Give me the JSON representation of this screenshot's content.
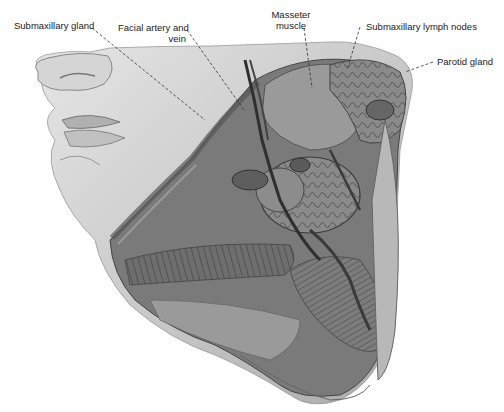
{
  "figure": {
    "labels": [
      {
        "id": "submaxillary-gland",
        "text": "Submaxillary gland"
      },
      {
        "id": "facial-artery-vein",
        "line1": "Facial artery and",
        "line2": "vein"
      },
      {
        "id": "masseter-muscle",
        "line1": "Masseter",
        "line2": "muscle"
      },
      {
        "id": "submaxillary-lymph-nodes",
        "text": "Submaxillary lymph nodes"
      },
      {
        "id": "parotid-gland",
        "text": "Parotid gland"
      }
    ]
  },
  "colors": {
    "background": "#ffffff",
    "skin_light": "#d8d8d8",
    "skin_mid": "#b5b5b5",
    "tissue_dark": "#6a6a6a",
    "tissue_darker": "#4a4a4a",
    "leader_line": "#333333",
    "label_text": "#222222"
  }
}
